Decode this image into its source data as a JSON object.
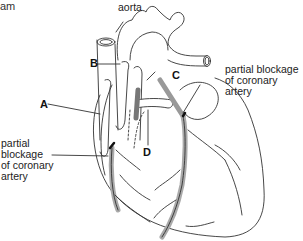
{
  "diagram": {
    "title_fragment": "am",
    "labels": {
      "aorta": "aorta",
      "A": "A",
      "B": "B",
      "C": "C",
      "D": "D",
      "blockage_right": "partial blockage\nof coronary\nartery",
      "blockage_left": "partial\nblockage\nof coronary\nartery"
    }
  }
}
